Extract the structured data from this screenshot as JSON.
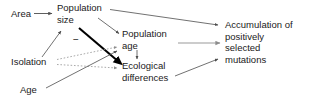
{
  "figure": {
    "type": "causal-path-diagram",
    "background_color": "#ffffff",
    "text_color": "#1a1a1a",
    "edge_color_default": "#4d4d4d",
    "edge_color_emphasis": "#000000",
    "edge_color_light": "#8c8c8c"
  },
  "nodes": [
    {
      "id": "area",
      "label": "Area"
    },
    {
      "id": "population_size",
      "label": "Population\nsize"
    },
    {
      "id": "isolation",
      "label": "Isolation"
    },
    {
      "id": "age",
      "label": "Age"
    },
    {
      "id": "population_age",
      "label": "Population\nage"
    },
    {
      "id": "ecological_differences",
      "label": "Ecological\ndifferences"
    },
    {
      "id": "accumulation",
      "label": "Accumulation of\npositively\nselected\nmutations"
    }
  ],
  "edge_labels": [
    {
      "id": "minus-sign",
      "text": "−"
    }
  ],
  "edges": [
    {
      "from": "area",
      "to": "population_size",
      "style": "solid",
      "weight": "thin"
    },
    {
      "from": "population_size",
      "to": "population_age",
      "style": "solid",
      "weight": "thin"
    },
    {
      "from": "population_size",
      "to": "ecological_differences",
      "style": "solid",
      "weight": "thick",
      "sign": "−"
    },
    {
      "from": "population_size",
      "to": "accumulation",
      "style": "solid",
      "weight": "thin"
    },
    {
      "from": "isolation",
      "to": "population_size",
      "style": "solid",
      "weight": "thin"
    },
    {
      "from": "isolation",
      "to": "population_age",
      "style": "dotted",
      "weight": "thin"
    },
    {
      "from": "isolation",
      "to": "ecological_differences",
      "style": "dotted",
      "weight": "thin"
    },
    {
      "from": "age",
      "to": "population_age",
      "style": "solid",
      "weight": "thin"
    },
    {
      "from": "population_age",
      "to": "ecological_differences",
      "style": "solid",
      "weight": "thin"
    },
    {
      "from": "population_age",
      "to": "accumulation",
      "style": "solid",
      "weight": "thin"
    },
    {
      "from": "ecological_differences",
      "to": "accumulation",
      "style": "solid",
      "weight": "thin"
    }
  ]
}
